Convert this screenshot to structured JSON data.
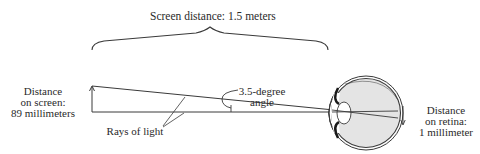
{
  "title": "Screen distance: 1.5 meters",
  "labels": {
    "screen_distance": [
      "Distance",
      "on screen:",
      "89 millimeters"
    ],
    "angle": [
      "3.5-degree",
      "angle"
    ],
    "rays": "Rays of light",
    "retina_distance": [
      "Distance",
      "on retina:",
      "1 millimeter"
    ]
  },
  "values": {
    "viewing_distance": "1.5 meters",
    "screen_size": "89 millimeters",
    "visual_angle": "3.5-degree",
    "retina_size": "1 millimeter"
  },
  "colors": {
    "line": "#3a3a3a",
    "eye_fill": "#e4e4e4",
    "background": "#ffffff"
  }
}
